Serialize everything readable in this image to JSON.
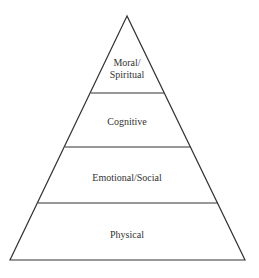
{
  "diagram": {
    "type": "pyramid",
    "levels": [
      {
        "label": "Moral/\nSpiritual",
        "line1": "Moral/",
        "line2": "Spiritual"
      },
      {
        "label": "Cognitive"
      },
      {
        "label": "Emotional/Social"
      },
      {
        "label": "Physical"
      }
    ],
    "colors": {
      "stroke": "#333333",
      "fill": "#ffffff"
    }
  }
}
